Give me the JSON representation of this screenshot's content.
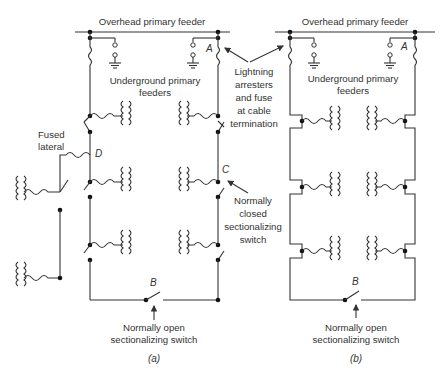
{
  "diagram": {
    "type": "electrical-schematic",
    "panel_a": {
      "caption": "(a)",
      "caption_letter": "a",
      "feeder_label": "Overhead primary feeder",
      "underground_label_line1": "Underground primary",
      "underground_label_line2": "feeders",
      "fused_lateral_line1": "Fused",
      "fused_lateral_line2": "lateral",
      "point_a": "A",
      "point_b": "B",
      "point_c": "C",
      "point_d": "D",
      "arrester_label": [
        "Lightning",
        "arresters",
        "and fuse",
        "at cable",
        "termination"
      ],
      "closed_switch_label": [
        "Normally",
        "closed",
        "sectionalizing",
        "switch"
      ],
      "open_switch_label_line1": "Normally open",
      "open_switch_label_line2": "sectionalizing switch"
    },
    "panel_b": {
      "caption": "(b)",
      "caption_letter": "b",
      "feeder_label": "Overhead primary feeder",
      "underground_label_line1": "Underground primary",
      "underground_label_line2": "feeders",
      "point_a": "A",
      "point_b": "B",
      "open_switch_label_line1": "Normally open",
      "open_switch_label_line2": "sectionalizing switch"
    },
    "colors": {
      "line": "#333333",
      "background": "#ffffff"
    }
  }
}
